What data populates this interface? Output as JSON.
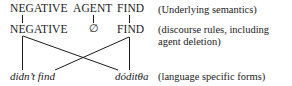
{
  "diagram": {
    "levels": [
      {
        "id": "semantics",
        "nodes": [
          "NEGATIVE",
          "AGENT",
          "FIND"
        ],
        "note": "(Underlying semantics)"
      },
      {
        "id": "discourse",
        "nodes": [
          "NEGATIVE",
          "∅",
          "FIND"
        ],
        "note_line1": "(discourse rules, including",
        "note_line2": "agent deletion)"
      },
      {
        "id": "forms",
        "nodes": [
          "didn’t find",
          "dóditθa"
        ],
        "note": "(language specific forms)"
      }
    ],
    "edges": [
      {
        "from": "semantics.NEGATIVE",
        "to": "discourse.NEGATIVE"
      },
      {
        "from": "semantics.AGENT",
        "to": "discourse.∅"
      },
      {
        "from": "semantics.FIND",
        "to": "discourse.FIND"
      },
      {
        "from": "discourse.NEGATIVE",
        "to": "forms.didn’t find"
      },
      {
        "from": "discourse.NEGATIVE",
        "to": "forms.dóditθa"
      },
      {
        "from": "discourse.FIND",
        "to": "forms.didn’t find"
      },
      {
        "from": "discourse.FIND",
        "to": "forms.dóditθa"
      }
    ]
  }
}
